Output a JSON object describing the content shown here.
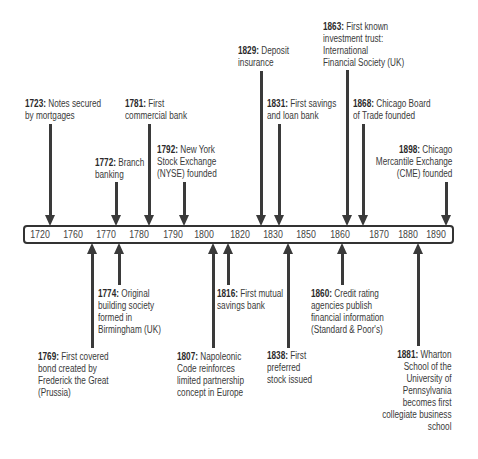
{
  "timeline": {
    "ticks": [
      "1720",
      "1760",
      "1770",
      "1780",
      "1790",
      "1800",
      "1820",
      "1830",
      "1850",
      "1860",
      "1870",
      "1880",
      "1890"
    ]
  },
  "events": [
    {
      "year": "1723:",
      "lines": [
        " Notes secured",
        "by mortgages"
      ],
      "side": "above"
    },
    {
      "year": "1781:",
      "lines": [
        " First",
        "commercial bank"
      ],
      "side": "above"
    },
    {
      "year": "1772:",
      "lines": [
        " Branch",
        "banking"
      ],
      "side": "above"
    },
    {
      "year": "1792:",
      "lines": [
        " New York",
        "Stock Exchange",
        "(NYSE) founded"
      ],
      "side": "above"
    },
    {
      "year": "1829:",
      "lines": [
        " Deposit",
        "insurance"
      ],
      "side": "above"
    },
    {
      "year": "1831:",
      "lines": [
        " First savings",
        "and loan bank"
      ],
      "side": "above"
    },
    {
      "year": "1863:",
      "lines": [
        " First known",
        "investment trust:",
        "International",
        "Financial Society (UK)"
      ],
      "side": "above"
    },
    {
      "year": "1868:",
      "lines": [
        " Chicago Board",
        "of Trade founded"
      ],
      "side": "above"
    },
    {
      "year": "1898:",
      "lines": [
        " Chicago",
        "Mercantile Exchange",
        "(CME) founded"
      ],
      "side": "above"
    },
    {
      "year": "1769:",
      "lines": [
        " First covered",
        "bond created by",
        "Frederick the Great",
        "(Prussia)"
      ],
      "side": "below"
    },
    {
      "year": "1774:",
      "lines": [
        " Original",
        "building society",
        "formed in",
        "Birmingham (UK)"
      ],
      "side": "below"
    },
    {
      "year": "1807:",
      "lines": [
        " Napoleonic",
        "Code reinforces",
        "limited partnership",
        "concept in Europe"
      ],
      "side": "below"
    },
    {
      "year": "1816:",
      "lines": [
        " First mutual",
        "savings bank"
      ],
      "side": "below"
    },
    {
      "year": "1838:",
      "lines": [
        " First",
        "preferred",
        "stock issued"
      ],
      "side": "below"
    },
    {
      "year": "1860:",
      "lines": [
        " Credit rating",
        "agencies publish",
        "financial information",
        "(Standard & Poor's)"
      ],
      "side": "below"
    },
    {
      "year": "1881:",
      "lines": [
        " Wharton",
        "School of the",
        "University of",
        "Pennsylvania",
        "becomes first",
        "collegiate business",
        "school"
      ],
      "side": "below"
    }
  ]
}
